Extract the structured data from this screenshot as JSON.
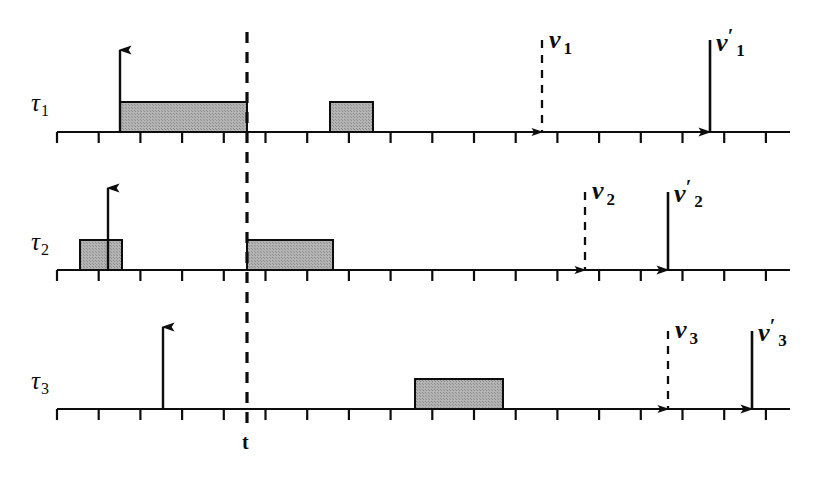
{
  "figure": {
    "type": "timing-diagram",
    "background_color": "#ffffff",
    "line_color": "#0d0d0d",
    "box_fill_color": "#a9a9a9",
    "box_stroke_color": "#0d0d0d"
  },
  "reference_line": {
    "label": "t",
    "style": "dashed",
    "x": 247
  },
  "axes": [
    {
      "id": "tau1",
      "label": "τ",
      "subscript": "1",
      "y": 132,
      "x_start": 57,
      "x_end": 790,
      "tick_spacing": 41.7,
      "tick_count": 18
    },
    {
      "id": "tau2",
      "label": "τ",
      "subscript": "2",
      "y": 270,
      "x_start": 57,
      "x_end": 790,
      "tick_spacing": 41.7,
      "tick_count": 18
    },
    {
      "id": "tau3",
      "label": "τ",
      "subscript": "3",
      "y": 409,
      "x_start": 57,
      "x_end": 790,
      "tick_spacing": 41.7,
      "tick_count": 18
    }
  ],
  "intervals": [
    {
      "axis": "tau1",
      "x_start": 120,
      "x_end": 247,
      "height": 30
    },
    {
      "axis": "tau1",
      "x_start": 330,
      "x_end": 373,
      "height": 30
    },
    {
      "axis": "tau2",
      "x_start": 80,
      "x_end": 122,
      "height": 30
    },
    {
      "axis": "tau2",
      "x_start": 247,
      "x_end": 333,
      "height": 30
    },
    {
      "axis": "tau3",
      "x_start": 415,
      "x_end": 503,
      "height": 30
    }
  ],
  "release_arrows": [
    {
      "axis": "tau1",
      "x": 120,
      "height": 82
    },
    {
      "axis": "tau2",
      "x": 108,
      "height": 82
    },
    {
      "axis": "tau3",
      "x": 163,
      "height": 82
    }
  ],
  "deadline_arrows": [
    {
      "axis": "tau1",
      "x": 542,
      "style": "dashed",
      "height": 92,
      "label": {
        "symbol": "ν",
        "subscript": "1",
        "prime": "",
        "text": "ν 1",
        "x": 549,
        "y": 25
      }
    },
    {
      "axis": "tau1",
      "x": 710,
      "style": "solid",
      "height": 92,
      "label": {
        "symbol": "ν",
        "subscript": "1",
        "prime": "′",
        "text": "ν ′1",
        "x": 716,
        "y": 25
      }
    },
    {
      "axis": "tau2",
      "x": 585,
      "style": "dashed",
      "height": 78,
      "label": {
        "symbol": "ν",
        "subscript": "2",
        "prime": "",
        "text": "ν 2",
        "x": 592,
        "y": 176
      }
    },
    {
      "axis": "tau2",
      "x": 668,
      "style": "solid",
      "height": 78,
      "label": {
        "symbol": "ν",
        "subscript": "2",
        "prime": "′",
        "text": "ν ′2",
        "x": 674,
        "y": 176
      }
    },
    {
      "axis": "tau3",
      "x": 668,
      "style": "dashed",
      "height": 78,
      "label": {
        "symbol": "ν",
        "subscript": "3",
        "prime": "",
        "text": "ν 3",
        "x": 675,
        "y": 315
      }
    },
    {
      "axis": "tau3",
      "x": 752,
      "style": "solid",
      "height": 78,
      "label": {
        "symbol": "ν",
        "subscript": "3",
        "prime": "′",
        "text": "ν ′3",
        "x": 758,
        "y": 315
      }
    }
  ],
  "axis_labels": [
    {
      "for": "tau1",
      "symbol": "τ",
      "subscript": "1",
      "x": 31,
      "y": 89
    },
    {
      "for": "tau2",
      "symbol": "τ",
      "subscript": "2",
      "x": 31,
      "y": 228
    },
    {
      "for": "tau3",
      "symbol": "τ",
      "subscript": "3",
      "x": 31,
      "y": 367
    }
  ]
}
